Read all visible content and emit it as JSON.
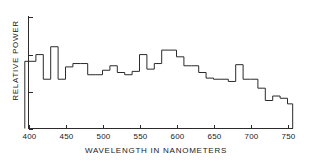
{
  "chart_data": {
    "type": "area",
    "render": "step",
    "title": "",
    "xlabel": "WAVELENGTH IN NANOMETERS",
    "ylabel": "RELATIVE POWER",
    "xlim": [
      395,
      757
    ],
    "ylim": [
      0,
      100
    ],
    "xticks": [
      400,
      450,
      500,
      550,
      600,
      650,
      700,
      750
    ],
    "xtick_labels": [
      "400",
      "450",
      "500",
      "550",
      "600",
      "650",
      "700",
      "750"
    ],
    "yticks": [
      0,
      33,
      66,
      100
    ],
    "ytick_labels": [
      "",
      "",
      "",
      ""
    ],
    "grid": false,
    "legend": null,
    "bin_width_nm": 10,
    "x": [
      400,
      410,
      420,
      430,
      440,
      450,
      460,
      470,
      480,
      490,
      500,
      510,
      520,
      530,
      540,
      550,
      560,
      570,
      580,
      590,
      600,
      610,
      620,
      630,
      640,
      650,
      660,
      670,
      680,
      690,
      700,
      710,
      720,
      730,
      740,
      750
    ],
    "values": [
      60,
      66,
      44,
      73,
      44,
      55,
      58,
      58,
      48,
      48,
      52,
      56,
      50,
      48,
      51,
      66,
      53,
      58,
      70,
      70,
      64,
      56,
      56,
      50,
      45,
      44,
      44,
      42,
      57,
      44,
      44,
      36,
      25,
      29,
      27,
      22
    ],
    "x_end": 755,
    "series": [
      {
        "name": "Relative spectral power",
        "values": [
          60,
          66,
          44,
          73,
          44,
          55,
          58,
          58,
          48,
          48,
          52,
          56,
          50,
          48,
          51,
          66,
          53,
          58,
          70,
          70,
          64,
          56,
          56,
          50,
          45,
          44,
          44,
          42,
          57,
          44,
          44,
          36,
          25,
          29,
          27,
          22
        ]
      }
    ],
    "line_color": "#2b2b2b",
    "background_color": "#ffffff"
  },
  "axes": {
    "x_title": "WAVELENGTH IN NANOMETERS",
    "y_title": "RELATIVE POWER"
  }
}
